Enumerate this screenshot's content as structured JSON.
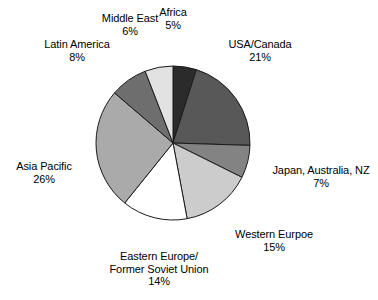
{
  "chart_data": {
    "type": "pie",
    "title": "",
    "subtitle": "",
    "xlabel": "",
    "ylabel": "",
    "legend_position": "none",
    "grid": false,
    "labels_outside": true,
    "start_angle_deg": 0,
    "direction": "clockwise",
    "categories": [
      "Africa",
      "USA/Canada",
      "Japan, Australia, NZ",
      "Western Eurpoe",
      "Eastern Europe/\nFormer Soviet Union",
      "Asia Pacific",
      "Latin America",
      "Middle East"
    ],
    "values": [
      5,
      21,
      7,
      15,
      14,
      26,
      8,
      6
    ],
    "value_labels": [
      "5%",
      "21%",
      "7%",
      "15%",
      "14%",
      "26%",
      "8%",
      "6%"
    ],
    "units": "percent",
    "total": 102,
    "slices": [
      {
        "name": "Africa",
        "value": 5,
        "label": "Africa",
        "pct_text": "5%",
        "color": "#2b2b2b"
      },
      {
        "name": "USA/Canada",
        "value": 21,
        "label": "USA/Canada",
        "pct_text": "21%",
        "color": "#585858"
      },
      {
        "name": "Japan, Australia, NZ",
        "value": 7,
        "label": "Japan, Australia, NZ",
        "pct_text": "7%",
        "color": "#838383"
      },
      {
        "name": "Western Eurpoe",
        "value": 15,
        "label": "Western Eurpoe",
        "pct_text": "15%",
        "color": "#cccccc"
      },
      {
        "name": "Eastern Europe/Former Soviet Union",
        "value": 14,
        "label_line1": "Eastern Europe/",
        "label_line2": "Former Soviet Union",
        "pct_text": "14%",
        "color": "#ffffff"
      },
      {
        "name": "Asia Pacific",
        "value": 26,
        "label": "Asia Pacific",
        "pct_text": "26%",
        "color": "#aaaaaa"
      },
      {
        "name": "Latin America",
        "value": 8,
        "label": "Latin America",
        "pct_text": "8%",
        "color": "#6e6e6e"
      },
      {
        "name": "Middle East",
        "value": 6,
        "label": "Middle East",
        "pct_text": "6%",
        "color": "#e2e2e2"
      }
    ],
    "stroke_color": "#1a1a1a",
    "background_color": "#ffffff"
  },
  "labels": {
    "africa": {
      "category": "Africa",
      "percent": "5%"
    },
    "usa_canada": {
      "category": "USA/Canada",
      "percent": "21%"
    },
    "japan": {
      "category": "Japan, Australia, NZ",
      "percent": "7%"
    },
    "western_europe": {
      "category": "Western Eurpoe",
      "percent": "15%"
    },
    "eastern_europe": {
      "line1": "Eastern Europe/",
      "line2": "Former Soviet Union",
      "percent": "14%"
    },
    "asia_pacific": {
      "category": "Asia Pacific",
      "percent": "26%"
    },
    "latin_america": {
      "category": "Latin America",
      "percent": "8%"
    },
    "middle_east": {
      "category": "Middle East",
      "percent": "6%"
    }
  }
}
